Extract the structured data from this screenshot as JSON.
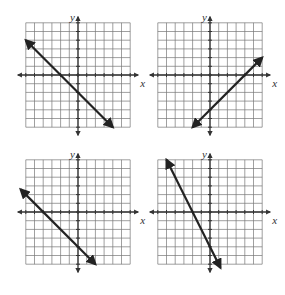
{
  "graphs": [
    {
      "id": "graph-1",
      "xlabel": "x",
      "ylabel": "y",
      "range": [
        -6,
        6
      ],
      "line": {
        "from": [
          -6,
          4
        ],
        "to": [
          4,
          -6
        ],
        "equation": "y = -x - 2"
      }
    },
    {
      "id": "graph-2",
      "xlabel": "x",
      "ylabel": "y",
      "range": [
        -6,
        6
      ],
      "line": {
        "from": [
          -2,
          -6
        ],
        "to": [
          6,
          2
        ],
        "equation": "y = x - 4"
      }
    },
    {
      "id": "graph-3",
      "xlabel": "x",
      "ylabel": "y",
      "range": [
        -6,
        6
      ],
      "line": {
        "from": [
          -6.6,
          2.6
        ],
        "to": [
          2,
          -6
        ],
        "equation": "y = -x - 4"
      }
    },
    {
      "id": "graph-4",
      "xlabel": "x",
      "ylabel": "y",
      "range": [
        -6,
        6
      ],
      "line": {
        "from": [
          -5,
          6
        ],
        "to": [
          1.2,
          -6.4
        ],
        "equation": "y = -2x - 4"
      }
    }
  ],
  "layout": {
    "origins": [
      [
        78,
        75
      ],
      [
        210,
        75
      ],
      [
        78,
        212
      ],
      [
        210,
        212
      ]
    ],
    "cell": 8.7
  }
}
